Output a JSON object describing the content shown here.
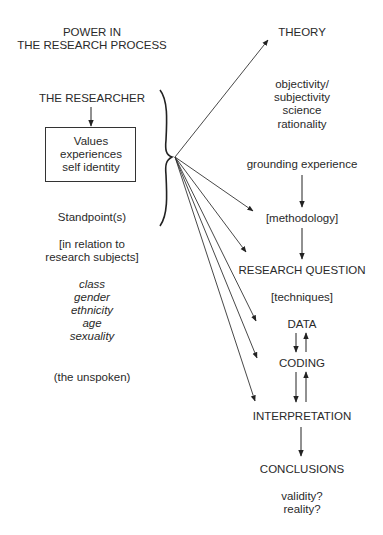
{
  "title": [
    "POWER IN",
    "THE RESEARCH PROCESS"
  ],
  "left": {
    "researcher": "THE RESEARCHER",
    "box": [
      "Values",
      "experiences",
      "self identity"
    ],
    "standpoint": "Standpoint(s)",
    "relation": [
      "[in relation to",
      "research subjects]"
    ],
    "dimensions": [
      "class",
      "gender",
      "ethnicity",
      "age",
      "sexuality"
    ],
    "unspoken": "(the unspoken)"
  },
  "right": {
    "theory": "THEORY",
    "theory_terms": [
      "objectivity/",
      "subjectivity",
      "science",
      "rationality"
    ],
    "grounding": "grounding experience",
    "methodology": "[methodology]",
    "research_question": "RESEARCH QUESTION",
    "techniques": "[techniques]",
    "data": "DATA",
    "coding": "CODING",
    "interpretation": "INTERPRETATION",
    "conclusions": "CONCLUSIONS",
    "validity": [
      "validity?",
      "reality?"
    ]
  }
}
